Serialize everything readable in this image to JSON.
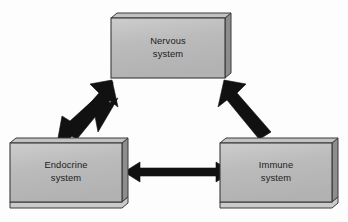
{
  "figure": {
    "title": "",
    "background_color": "#fdfdfd"
  },
  "style": {
    "box_face_color": "#b9b9b9",
    "box_side_color": "#8f8f8f",
    "box_bottom_color": "#c9c9c9",
    "box_stroke_color": "#3a3a3a",
    "box_face_highlight": "#cfcfcf",
    "arrow_color": "#111111",
    "label_color": "#1c1c1c"
  },
  "diagram_data": {
    "type": "diagram",
    "layout": "triangle",
    "nodes": [
      {
        "id": "nervous",
        "label_line1": "Nervous",
        "label_line2": "system",
        "position": "top-center"
      },
      {
        "id": "endocrine",
        "label_line1": "Endocrine",
        "label_line2": "system",
        "position": "bottom-left"
      },
      {
        "id": "immune",
        "label_line1": "Immune",
        "label_line2": "system",
        "position": "bottom-right"
      }
    ],
    "edges": [
      {
        "id": "nervous-endocrine",
        "from": "nervous",
        "to": "endocrine",
        "direction": "bidirectional",
        "label": ""
      },
      {
        "id": "nervous-immune",
        "from": "nervous",
        "to": "immune",
        "direction": "bidirectional",
        "label": ""
      },
      {
        "id": "endocrine-immune",
        "from": "endocrine",
        "to": "immune",
        "direction": "bidirectional",
        "label": ""
      }
    ]
  }
}
